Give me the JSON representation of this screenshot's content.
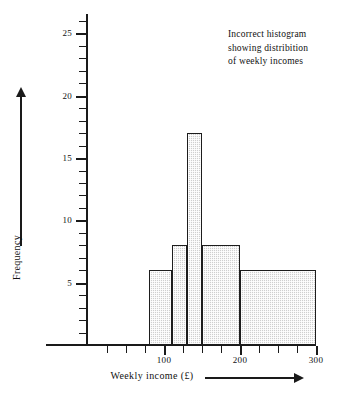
{
  "chart_data": {
    "type": "bar",
    "title": "",
    "annotation": [
      "Incorrect histogram",
      "showing distribition",
      "of weekly incomes"
    ],
    "xlabel": "Weekly income (£)",
    "ylabel": "Frequency",
    "xlim": [
      0,
      325
    ],
    "ylim": [
      0,
      26
    ],
    "grid": false,
    "legend": null,
    "x_tick_interval": 25,
    "x_major_ticks": [
      100,
      200,
      300
    ],
    "x_tick_labels": [
      "100",
      "200",
      "300"
    ],
    "x_minor_ticks": [
      25,
      50,
      75,
      125,
      150,
      175,
      225,
      250,
      275
    ],
    "y_tick_interval": 1,
    "y_major_ticks": [
      5,
      10,
      15,
      20,
      25
    ],
    "y_tick_labels": [
      "5",
      "10",
      "15",
      "20",
      "25"
    ],
    "bins": [
      {
        "label": "80-110",
        "x_start": 80,
        "x_end": 110,
        "value": 6
      },
      {
        "label": "110-130",
        "x_start": 110,
        "x_end": 130,
        "value": 8
      },
      {
        "label": "130-150",
        "x_start": 130,
        "x_end": 150,
        "value": 17
      },
      {
        "label": "150-200",
        "x_start": 150,
        "x_end": 200,
        "value": 8
      },
      {
        "label": "200-300",
        "x_start": 200,
        "x_end": 300,
        "value": 6
      }
    ],
    "categories": [
      "80-110",
      "110-130",
      "130-150",
      "150-200",
      "200-300"
    ],
    "values": [
      6,
      8,
      17,
      8,
      6
    ],
    "colors": {
      "bar_fill": "#cfcfcf",
      "bar_edge": "#1d1d1d",
      "axis": "#1a1a1a",
      "text": "#111111"
    }
  }
}
